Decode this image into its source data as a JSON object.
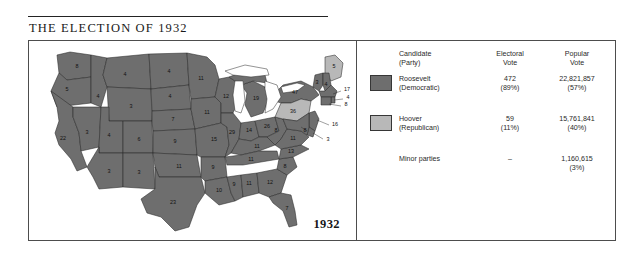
{
  "figure": {
    "title": "THE ELECTION OF 1932",
    "year_label": "1932"
  },
  "legend": {
    "headers": {
      "candidate": "Candidate",
      "candidate_sub": "(Party)",
      "electoral": "Electoral",
      "electoral_sub": "Vote",
      "popular": "Popular",
      "popular_sub": "Vote"
    },
    "rows": [
      {
        "name": "Roosevelt",
        "party": "(Democratic)",
        "electoral": "472",
        "electoral_pct": "(89%)",
        "popular": "22,821,857",
        "popular_pct": "(57%)",
        "swatch_color": "#6e6e6e"
      },
      {
        "name": "Hoover",
        "party": "(Republican)",
        "electoral": "59",
        "electoral_pct": "(11%)",
        "popular": "15,761,841",
        "popular_pct": "(40%)",
        "swatch_color": "#b8b8b8"
      },
      {
        "name": "Minor parties",
        "party": "",
        "electoral": "–",
        "electoral_pct": "",
        "popular": "1,160,615",
        "popular_pct": "(3%)",
        "swatch_color": null
      }
    ]
  },
  "colors": {
    "democratic_fill": "#6e6e6e",
    "republican_fill": "#b8b8b8",
    "water_fill": "#ffffff",
    "border_stroke": "#2b2b2b",
    "panel_border": "#4d4d4d"
  },
  "map": {
    "type": "choropleth-electoral",
    "states": [
      {
        "code": "WA",
        "votes": "8",
        "winner": "roosevelt",
        "lx": 48,
        "ly": 26
      },
      {
        "code": "OR",
        "votes": "5",
        "winner": "roosevelt",
        "lx": 38,
        "ly": 49
      },
      {
        "code": "CA",
        "votes": "22",
        "winner": "roosevelt",
        "lx": 34,
        "ly": 98
      },
      {
        "code": "ID",
        "votes": "4",
        "winner": "roosevelt",
        "lx": 69,
        "ly": 56
      },
      {
        "code": "NV",
        "votes": "3",
        "winner": "roosevelt",
        "lx": 58,
        "ly": 92
      },
      {
        "code": "MT",
        "votes": "4",
        "winner": "roosevelt",
        "lx": 96,
        "ly": 34
      },
      {
        "code": "WY",
        "votes": "3",
        "winner": "roosevelt",
        "lx": 102,
        "ly": 68
      },
      {
        "code": "UT",
        "votes": "4",
        "winner": "roosevelt",
        "lx": 80,
        "ly": 95
      },
      {
        "code": "CO",
        "votes": "6",
        "winner": "roosevelt",
        "lx": 110,
        "ly": 101
      },
      {
        "code": "AZ",
        "votes": "3",
        "winner": "roosevelt",
        "lx": 80,
        "ly": 131
      },
      {
        "code": "NM",
        "votes": "3",
        "winner": "roosevelt",
        "lx": 112,
        "ly": 136
      },
      {
        "code": "ND",
        "votes": "4",
        "winner": "roosevelt",
        "lx": 140,
        "ly": 33
      },
      {
        "code": "SD",
        "votes": "4",
        "winner": "roosevelt",
        "lx": 141,
        "ly": 56
      },
      {
        "code": "NE",
        "votes": "7",
        "winner": "roosevelt",
        "lx": 144,
        "ly": 79
      },
      {
        "code": "KS",
        "votes": "9",
        "winner": "roosevelt",
        "lx": 148,
        "ly": 103
      },
      {
        "code": "OK",
        "votes": "11",
        "winner": "roosevelt",
        "lx": 152,
        "ly": 126
      },
      {
        "code": "TX",
        "votes": "23",
        "winner": "roosevelt",
        "lx": 143,
        "ly": 163
      },
      {
        "code": "MN",
        "votes": "11",
        "winner": "roosevelt",
        "lx": 172,
        "ly": 42
      },
      {
        "code": "IA",
        "votes": "11",
        "winner": "roosevelt",
        "lx": 177,
        "ly": 72
      },
      {
        "code": "MO",
        "votes": "15",
        "winner": "roosevelt",
        "lx": 185,
        "ly": 97
      },
      {
        "code": "AR",
        "votes": "9",
        "winner": "roosevelt",
        "lx": 184,
        "ly": 127
      },
      {
        "code": "LA",
        "votes": "10",
        "winner": "roosevelt",
        "lx": 192,
        "ly": 152
      },
      {
        "code": "WI",
        "votes": "12",
        "winner": "roosevelt",
        "lx": 196,
        "ly": 57
      },
      {
        "code": "IL",
        "votes": "29",
        "winner": "roosevelt",
        "lx": 205,
        "ly": 85
      },
      {
        "code": "MS",
        "votes": "9",
        "winner": "roosevelt",
        "lx": 205,
        "ly": 141
      },
      {
        "code": "MI",
        "votes": "19",
        "winner": "roosevelt",
        "lx": 225,
        "ly": 60
      },
      {
        "code": "IN",
        "votes": "14",
        "winner": "roosevelt",
        "lx": 220,
        "ly": 86
      },
      {
        "code": "AL",
        "votes": "11",
        "winner": "roosevelt",
        "lx": 221,
        "ly": 139
      },
      {
        "code": "OH",
        "votes": "26",
        "winner": "roosevelt",
        "lx": 238,
        "ly": 84
      },
      {
        "code": "TN",
        "votes": "11",
        "winner": "roosevelt",
        "lx": 222,
        "ly": 117
      },
      {
        "code": "KY",
        "votes": "11",
        "winner": "roosevelt",
        "lx": 228,
        "ly": 104
      },
      {
        "code": "GA",
        "votes": "12",
        "winner": "roosevelt",
        "lx": 240,
        "ly": 139
      },
      {
        "code": "FL",
        "votes": "7",
        "winner": "roosevelt",
        "lx": 259,
        "ly": 168
      },
      {
        "code": "SC",
        "votes": "8",
        "winner": "roosevelt",
        "lx": 253,
        "ly": 125
      },
      {
        "code": "NC",
        "votes": "13",
        "winner": "roosevelt",
        "lx": 258,
        "ly": 112
      },
      {
        "code": "WV",
        "votes": "8",
        "winner": "roosevelt",
        "lx": 249,
        "ly": 95
      },
      {
        "code": "VA",
        "votes": "11",
        "winner": "roosevelt",
        "lx": 262,
        "ly": 98
      },
      {
        "code": "NY",
        "votes": "47",
        "winner": "roosevelt",
        "lx": 268,
        "ly": 50
      },
      {
        "code": "PA",
        "votes": "36",
        "winner": "hoover",
        "lx": 263,
        "ly": 72
      },
      {
        "code": "ME",
        "votes": "5",
        "winner": "hoover",
        "lx": 305,
        "ly": 27
      },
      {
        "code": "VT",
        "votes": "3",
        "winner": "hoover",
        "lx": 287,
        "ly": 43
      },
      {
        "code": "NH",
        "votes": "4",
        "winner": "roosevelt",
        "lx": 296,
        "ly": 47
      },
      {
        "code": "MA",
        "votes": "17",
        "winner": "roosevelt",
        "lx": 313,
        "ly": 57
      },
      {
        "code": "RI",
        "votes": "4",
        "winner": "roosevelt",
        "lx": 312,
        "ly": 68
      },
      {
        "code": "CT",
        "votes": "8",
        "winner": "roosevelt",
        "lx": 310,
        "ly": 75
      },
      {
        "code": "NJ",
        "votes": "16",
        "winner": "roosevelt",
        "lx": 300,
        "ly": 90
      },
      {
        "code": "DE",
        "votes": "3",
        "winner": "roosevelt",
        "lx": 294,
        "ly": 104
      },
      {
        "code": "MD",
        "votes": "8",
        "winner": "roosevelt",
        "lx": 276,
        "ly": 90
      }
    ]
  }
}
